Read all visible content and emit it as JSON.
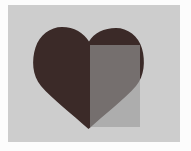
{
  "scene": {
    "title": "Heart shape with translucent rectangle overlay",
    "canvas": {
      "width": 191,
      "height": 151,
      "background_color": "#fcfcfc"
    },
    "panel": {
      "name": "artboard",
      "x": 8,
      "y": 5,
      "width": 172,
      "height": 137,
      "fill_color": "#cdcdcd"
    },
    "shapes": [
      {
        "id": "heart",
        "label": "heart",
        "type": "path",
        "fill_color": "#3b2a28",
        "bounds": {
          "x": 33,
          "y": 27,
          "width": 111,
          "height": 102
        },
        "apex_point": {
          "x": 88,
          "y": 129
        },
        "cleft_point": {
          "x": 89,
          "y": 34
        },
        "left_lobe_top_y": 27,
        "right_lobe_top_y": 28,
        "left_edge_x": 33,
        "right_edge_x": 144
      },
      {
        "id": "overlay-rect",
        "label": "translucent rectangle",
        "type": "rect",
        "fill_color": "#9a9a9a",
        "opacity": 0.62,
        "bounds": {
          "x": 90,
          "y": 45,
          "width": 50,
          "height": 82
        },
        "left_edge_x": 90,
        "top_edge_y": 45,
        "right_edge_x": 140,
        "bottom_edge_y": 127
      }
    ],
    "derived_colors": {
      "heart_only": "#3b2a28",
      "heart_under_rect": "#5a4a47",
      "panel_under_rect": "#a8a8a8",
      "panel_only": "#cdcdcd"
    }
  }
}
